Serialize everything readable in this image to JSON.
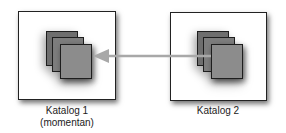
{
  "diagram": {
    "nodes": [
      {
        "id": "katalog1",
        "label": "Katalog 1",
        "sublabel": "(momentan)"
      },
      {
        "id": "katalog2",
        "label": "Katalog 2"
      }
    ],
    "edges": [
      {
        "from": "katalog2",
        "to": "katalog1",
        "style": "arrow",
        "color": "#a8a8a8"
      }
    ]
  },
  "colors": {
    "box_border": "#222222",
    "sheet_dark": "#6e6e6e",
    "sheet_mid": "#7d7d7d",
    "sheet_light": "#8c8c8c",
    "arrow": "#a8a8a8"
  }
}
